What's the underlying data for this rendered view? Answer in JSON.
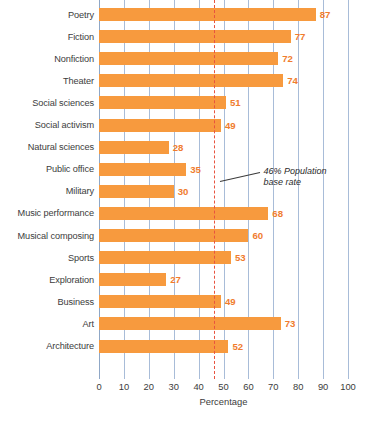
{
  "chart_data": {
    "type": "bar",
    "orientation": "horizontal",
    "title": "",
    "xlabel": "Percentage",
    "ylabel": "",
    "xlim": [
      0,
      100
    ],
    "xticks": [
      0,
      10,
      20,
      30,
      40,
      50,
      60,
      70,
      80,
      90,
      100
    ],
    "grid": "vertical",
    "legend": "none",
    "categories": [
      "Poetry",
      "Fiction",
      "Nonfiction",
      "Theater",
      "Social sciences",
      "Social activism",
      "Natural sciences",
      "Public office",
      "Military",
      "Music performance",
      "Musical composing",
      "Sports",
      "Exploration",
      "Business",
      "Art",
      "Architecture"
    ],
    "values": [
      87,
      77,
      72,
      74,
      51,
      49,
      28,
      35,
      30,
      68,
      60,
      53,
      27,
      49,
      73,
      52
    ],
    "annotations": [
      {
        "text_line1": "46% Population",
        "text_line2": "base rate",
        "value": 46,
        "style": "dashed-reference-line"
      }
    ],
    "colors": {
      "bar": "#F79A3E",
      "value_label": "#F07C2E",
      "gridline": "#A8BCD8",
      "reference_line": "#E8533F",
      "axis_text": "#3C3C3C",
      "background": "#FFFFFF"
    }
  },
  "source_note": ""
}
